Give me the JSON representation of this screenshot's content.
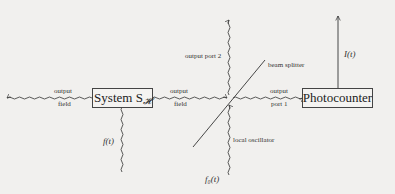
{
  "diagram": {
    "type": "block-diagram",
    "nodes": [
      {
        "id": "system",
        "label": "System S",
        "subscript": "𝓗"
      },
      {
        "id": "photocounter",
        "label": "Photocounter"
      },
      {
        "id": "beam_splitter",
        "label": "beam splitter"
      }
    ],
    "labels": {
      "left_output_top": "output",
      "left_output_bottom": "field",
      "mid_output_top": "output",
      "mid_output_bottom": "field",
      "port1_top": "output",
      "port1_bottom": "port 1",
      "port2": "output port 2",
      "beam_splitter": "beam splitter",
      "local_oscillator": "local oscillator",
      "input_f": "f(t)",
      "input_f0": "f₀(t)",
      "current": "I(t)"
    },
    "edges": [
      {
        "from": "system",
        "to": "left",
        "label": "output field",
        "style": "wavy"
      },
      {
        "from": "system",
        "to": "beam_splitter",
        "label": "output field",
        "style": "wavy"
      },
      {
        "from": "beam_splitter",
        "to": "photocounter",
        "label": "output port 1",
        "style": "wavy"
      },
      {
        "from": "beam_splitter",
        "to": "up",
        "label": "output port 2",
        "style": "wavy"
      },
      {
        "from": "f(t)",
        "to": "system",
        "style": "wavy"
      },
      {
        "from": "f₀(t)",
        "to": "beam_splitter",
        "label": "local oscillator",
        "style": "wavy"
      },
      {
        "from": "photocounter",
        "to": "up",
        "label": "I(t)",
        "style": "straight"
      }
    ]
  }
}
